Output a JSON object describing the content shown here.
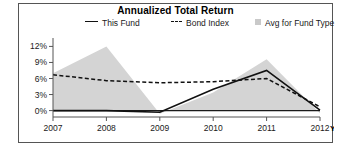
{
  "chart_data": {
    "type": "area",
    "title": "Annualized Total Return",
    "xlabel": "",
    "ylabel": "",
    "x": [
      "2007",
      "2008",
      "2009",
      "2010",
      "2011",
      "2012"
    ],
    "x_suffix_label": "YTD",
    "ylim": [
      -1.2,
      13.2
    ],
    "yticks": [
      0,
      3,
      6,
      9,
      12
    ],
    "ytick_labels": [
      "0%",
      "3%",
      "6%",
      "9%",
      "12%"
    ],
    "grid": false,
    "legend_position": "top",
    "series": [
      {
        "name": "This Fund",
        "style": "solid-line",
        "color": "#111111",
        "values": [
          0.0,
          0.0,
          -0.3,
          4.0,
          7.5,
          0.1
        ]
      },
      {
        "name": "Bond Index",
        "style": "dashed-line",
        "color": "#111111",
        "values": [
          6.7,
          5.6,
          5.2,
          5.4,
          6.0,
          0.7
        ]
      },
      {
        "name": "Avg for Fund Type",
        "style": "filled-area",
        "color": "#d4d4d4",
        "values": [
          7.0,
          12.0,
          -0.6,
          3.4,
          9.6,
          -0.5
        ]
      }
    ]
  },
  "chart": {
    "title": "Annualized Total Return",
    "legend": [
      {
        "label": "This Fund",
        "marker": "solid-line-marker"
      },
      {
        "label": "Bond Index",
        "marker": "dashed-line-marker"
      },
      {
        "label": "Avg for Fund Type",
        "marker": "gray-square-swatch"
      }
    ],
    "y_axis": {
      "labels": [
        "12%",
        "9%",
        "6%",
        "3%",
        "0%"
      ]
    },
    "x_axis": {
      "labels": [
        "2007",
        "2008",
        "2009",
        "2010",
        "2011",
        "2012"
      ],
      "ytd": "YTD"
    },
    "colors": {
      "area_fill": "#d4d4d4",
      "line": "#111111",
      "axis": "#555555",
      "border": "#555555"
    }
  }
}
